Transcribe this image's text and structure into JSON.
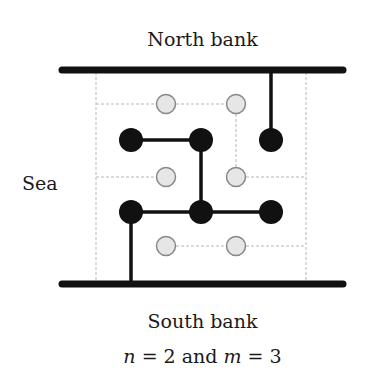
{
  "labels": {
    "north": "North bank",
    "south": "South bank",
    "sea": "Sea",
    "caption_n_var": "n",
    "caption_eq1": " = 2 and ",
    "caption_m_var": "m",
    "caption_eq2": " = 3"
  },
  "parameters": {
    "n": 2,
    "m": 3
  },
  "colors": {
    "bank": "#111111",
    "black_node": "#111111",
    "gray_node_fill": "#e6e6e6",
    "gray_node_stroke": "#888888",
    "grid_dash": "#cfcfcf",
    "edge": "#111111"
  },
  "diagram": {
    "black_nodes": [
      {
        "row": 1,
        "col": 1
      },
      {
        "row": 1,
        "col": 2
      },
      {
        "row": 1,
        "col": 3
      },
      {
        "row": 2,
        "col": 1
      },
      {
        "row": 2,
        "col": 2
      },
      {
        "row": 2,
        "col": 3
      }
    ],
    "gray_nodes": [
      {
        "row": 1,
        "col": 1
      },
      {
        "row": 1,
        "col": 2
      },
      {
        "row": 2,
        "col": 1
      },
      {
        "row": 2,
        "col": 2
      },
      {
        "row": 3,
        "col": 1
      },
      {
        "row": 3,
        "col": 2
      }
    ],
    "black_edges": [
      "black(1,1)-black(1,2)",
      "black(1,2)-black(2,2)",
      "black(2,1)-black(2,2)",
      "black(2,2)-black(2,3)",
      "north-black(1,3)",
      "black(2,1)-south"
    ]
  }
}
